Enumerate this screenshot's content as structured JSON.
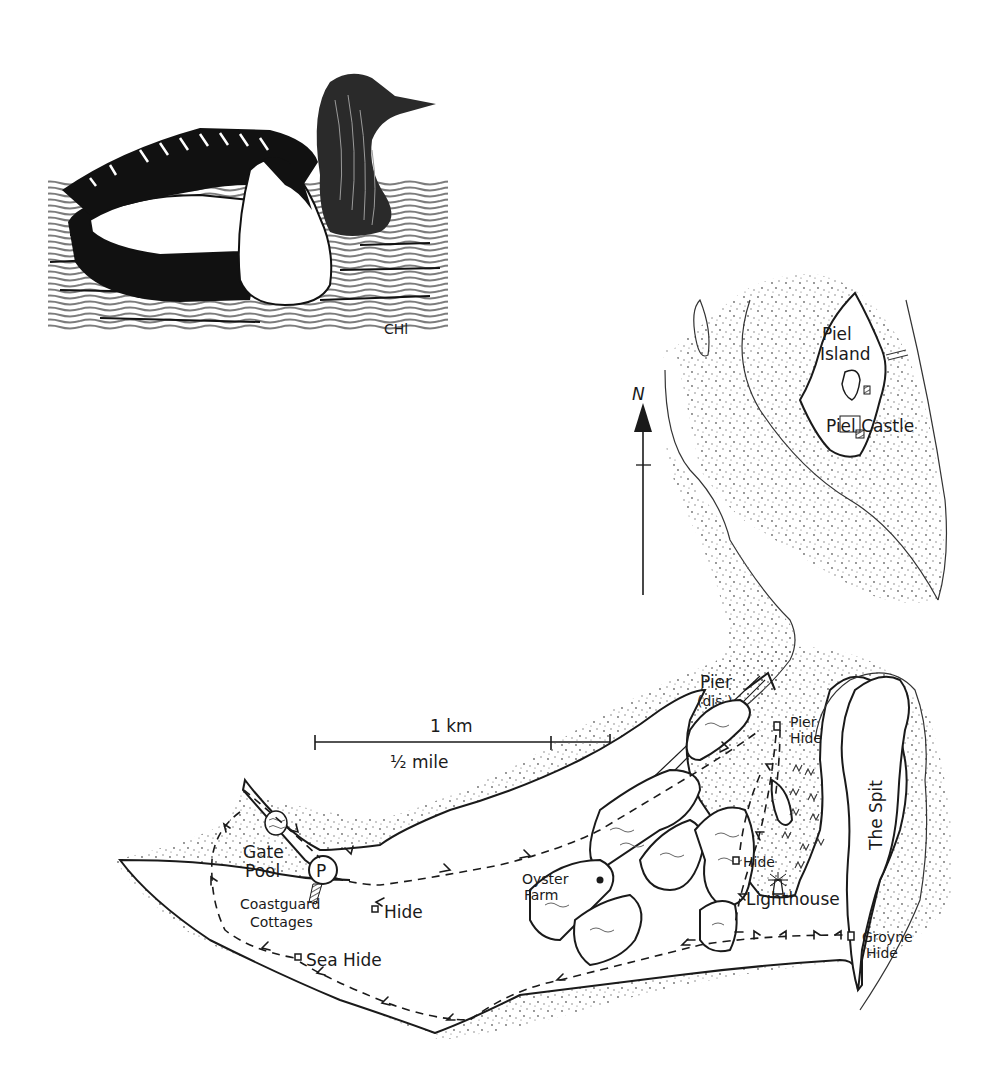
{
  "illustration": {
    "subject": "duck-pair-on-water",
    "signature": "CHl"
  },
  "compass": {
    "label": "N"
  },
  "scale_bar": {
    "km_label": "1 km",
    "mile_label": "½ mile"
  },
  "places": {
    "piel_island_line1": "Piel",
    "piel_island_line2": "Island",
    "piel_castle": "Piel Castle",
    "pier_line1": "Pier",
    "pier_line2": "(dis.)",
    "pier_hide_line1": "Pier",
    "pier_hide_line2": "Hide",
    "the_spit": "The Spit",
    "gate_pool_line1": "Gate",
    "gate_pool_line2": "Pool",
    "parking": "P",
    "coastguard_line1": "Coastguard",
    "coastguard_line2": "Cottages",
    "hide_west": "Hide",
    "sea_hide": "Sea Hide",
    "oyster_farm_line1": "Oyster",
    "oyster_farm_line2": "Farm",
    "hide_central": "Hide",
    "lighthouse": "Lighthouse",
    "groyne_hide_line1": "Groyne",
    "groyne_hide_line2": "Hide"
  },
  "colors": {
    "ink": "#1a1a1a",
    "paper": "#ffffff",
    "stipple": "#6b6b6b"
  }
}
